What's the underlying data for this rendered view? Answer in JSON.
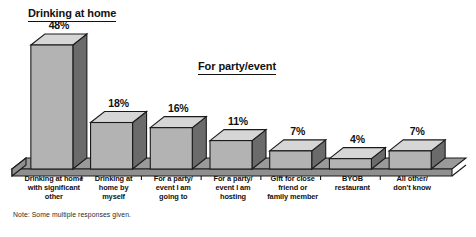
{
  "chart_data": {
    "type": "bar",
    "title": "",
    "xlabel": "",
    "ylabel": "",
    "ylim": [
      0,
      48
    ],
    "grid": false,
    "legend": "none",
    "note": "Note: Some multiple responses given.",
    "group_titles": [
      {
        "id": "drinking-at-home",
        "label": "Drinking at home"
      },
      {
        "id": "for-party-event",
        "label": "For party/event"
      }
    ],
    "categories": [
      "Drinking at home with significant other",
      "Drinking at home by myself",
      "For a party/event I am going to",
      "For a party/event I am hosting",
      "Gift for close friend or family member",
      "BYOB restaurant",
      "All other/don't know"
    ],
    "category_lines": [
      [
        "Drinking at home",
        "with significant",
        "other"
      ],
      [
        "Drinking at",
        "home by",
        "myself"
      ],
      [
        "For a party/",
        "event I am",
        "going to"
      ],
      [
        "For a party/",
        "event I am",
        "hosting"
      ],
      [
        "Gift for close",
        "friend or",
        "family member"
      ],
      [
        "BYOB",
        "restaurant"
      ],
      [
        "All other/",
        "don't know"
      ]
    ],
    "values": [
      48,
      18,
      16,
      11,
      7,
      4,
      7
    ],
    "value_labels": [
      "48%",
      "18%",
      "16%",
      "11%",
      "7%",
      "4%",
      "7%"
    ],
    "colors": {
      "bar_front": "#b3b3b3",
      "bar_side": "#6b6b6b",
      "bar_top": "#d6d6d6",
      "floor_top": "#9a9a9a",
      "floor_front": "#8f8f8f",
      "outline": "#1a1a1a",
      "text": "#111111",
      "background": "#ffffff"
    }
  }
}
